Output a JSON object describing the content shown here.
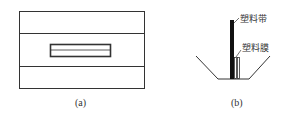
{
  "figure_a": {
    "caption": "(a)"
  },
  "figure_b": {
    "caption": "(b)",
    "labels": {
      "strip": "塑料带",
      "film": "塑料膜"
    }
  }
}
